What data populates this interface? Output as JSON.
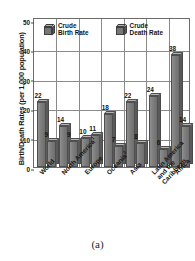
{
  "chart_data": {
    "type": "bar",
    "title": "",
    "xlabel": "",
    "ylabel": "Birth/Death Rates (per 1,000 population)",
    "ylim": [
      0,
      50
    ],
    "yticks": [
      0,
      10,
      20,
      30,
      40,
      50
    ],
    "grid": true,
    "legend_position": "top-inside",
    "categories": [
      "World",
      "North America",
      "Europe",
      "Oceania",
      "Asia",
      "Latin America and the Caribbean",
      "Africa"
    ],
    "category_footnotes": [
      "",
      "1",
      "",
      "2",
      "",
      "",
      ""
    ],
    "series": [
      {
        "name": "Crude Birth Rate",
        "values": [
          22,
          14,
          10,
          18,
          22,
          24,
          38
        ]
      },
      {
        "name": "Crude Death Rate",
        "values": [
          9,
          9,
          11,
          7,
          8,
          6,
          14
        ]
      }
    ]
  },
  "axis": {
    "y_title": "Birth/Death Rates (per 1,000 population)",
    "y_tick_labels": [
      "0",
      "10",
      "20",
      "30",
      "40",
      "50"
    ]
  },
  "legend": {
    "items": [
      {
        "label_line1": "Crude",
        "label_line2": "Birth Rate"
      },
      {
        "label_line1": "Crude",
        "label_line2": "Death Rate"
      }
    ]
  },
  "caption": {
    "text": "(a)"
  },
  "colors": {
    "bar_front": "#7d7d7d",
    "bar_top": "#b4b4b4",
    "bar_side": "#5a5a5a",
    "grid": "#8a8a8a",
    "frame": "#6b6b6b",
    "text": "#141414"
  }
}
